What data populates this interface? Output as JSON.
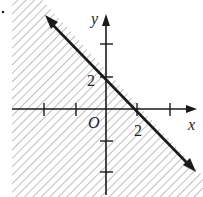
{
  "figure": {
    "type": "linear-inequality-graph",
    "inequality": "x + y ≤ 2",
    "boundary_line": "x + y = 2",
    "boundary_style": "solid",
    "shaded_region": "below-left of line (includes origin)",
    "labels": {
      "x_axis": "x",
      "y_axis": "y",
      "origin": "O",
      "x_intercept": "2",
      "y_intercept": "2"
    },
    "intercepts": {
      "x": [
        2,
        0
      ],
      "y": [
        0,
        2
      ]
    },
    "ticks": {
      "x": [
        -2,
        -1,
        1,
        2,
        3
      ],
      "y": [
        -2,
        -1,
        1,
        2,
        3
      ]
    },
    "colors": {
      "ink": "#1a1a1a",
      "hatch": "#888888",
      "background": "#ffffff"
    }
  }
}
